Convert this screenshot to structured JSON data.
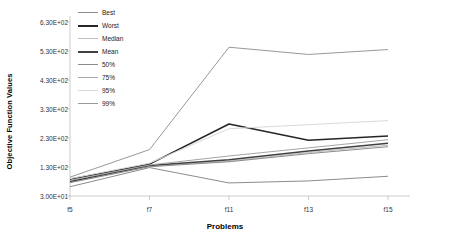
{
  "chart_data": {
    "type": "line",
    "title": "",
    "xlabel": "Problems",
    "ylabel": "Objective Function Values",
    "categories": [
      "f5",
      "f7",
      "f11",
      "f13",
      "f15"
    ],
    "ytick_labels": [
      "6.30E+02",
      "5.30E+02",
      "4.30E+02",
      "3.30E+02",
      "2.30E+02",
      "1.30E+02",
      "3.00E+01"
    ],
    "ytick_values": [
      630,
      530,
      430,
      330,
      230,
      130,
      30
    ],
    "ylim": [
      30,
      630
    ],
    "grid": false,
    "legend_position": "top-left-inside",
    "series": [
      {
        "name": "Best",
        "color": "#8c8c8c",
        "width": 1.0,
        "values": [
          62,
          128,
          75,
          82,
          98
        ]
      },
      {
        "name": "Worst",
        "color": "#262626",
        "width": 1.6,
        "values": [
          88,
          140,
          278,
          222,
          237
        ]
      },
      {
        "name": "Median",
        "color": "#bfbfbf",
        "width": 1.0,
        "values": [
          78,
          133,
          150,
          180,
          205
        ]
      },
      {
        "name": "Mean",
        "color": "#404040",
        "width": 1.6,
        "values": [
          80,
          135,
          155,
          185,
          212
        ]
      },
      {
        "name": "50%",
        "color": "#8c8c8c",
        "width": 1.0,
        "values": [
          76,
          131,
          148,
          176,
          200
        ]
      },
      {
        "name": "75%",
        "color": "#a6a6a6",
        "width": 1.0,
        "values": [
          84,
          137,
          168,
          196,
          224
        ]
      },
      {
        "name": "95%",
        "color": "#d9d9d9",
        "width": 1.0,
        "values": [
          90,
          143,
          262,
          276,
          290
        ]
      },
      {
        "name": "99%",
        "color": "#999999",
        "width": 1.0,
        "values": [
          95,
          190,
          543,
          518,
          535
        ]
      }
    ]
  },
  "legend": {
    "items": [
      {
        "label": "Best"
      },
      {
        "label": "Worst"
      },
      {
        "label": "Median"
      },
      {
        "label": "Mean"
      },
      {
        "label": "50%"
      },
      {
        "label": "75%"
      },
      {
        "label": "95%"
      },
      {
        "label": "99%"
      }
    ]
  }
}
